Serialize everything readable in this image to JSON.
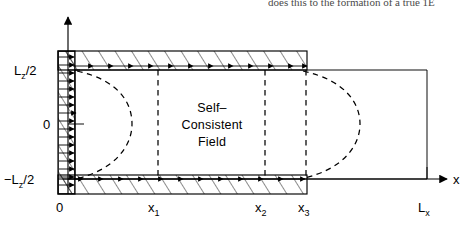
{
  "figure": {
    "kind": "physics-schematic",
    "caption_bleed": "does this to the formation of a true 1E",
    "region_label_lines": [
      "Self–",
      "Consistent",
      "Field"
    ],
    "axes": {
      "x_axis_label": "x",
      "z_axis_label": "",
      "x_ticks": [
        {
          "key": "origin",
          "label": "0",
          "sub": ""
        },
        {
          "key": "x1",
          "label": "x",
          "sub": "1"
        },
        {
          "key": "x2",
          "label": "x",
          "sub": "2"
        },
        {
          "key": "x3",
          "label": "x",
          "sub": "3"
        },
        {
          "key": "Lx",
          "label": "L",
          "sub": "x"
        }
      ],
      "z_ticks": [
        {
          "key": "top",
          "label": "L",
          "sub": "z",
          "suffix": "/2"
        },
        {
          "key": "mid",
          "label": "0",
          "sub": "",
          "suffix": ""
        },
        {
          "key": "bot",
          "label": "−L",
          "sub": "z",
          "suffix": "/2"
        }
      ]
    },
    "colors": {
      "ink": "#000000",
      "background": "#ffffff",
      "bleed_text": "#4a4a4a"
    },
    "elements": {
      "top_wall_name": "top hatched wall",
      "bottom_wall_name": "bottom hatched wall",
      "left_wall_name": "left hatched wall",
      "left_dashed_curve_name": "left dashed separatrix",
      "right_dashed_curve_name": "right dashed separatrix",
      "dashed_verticals": [
        "x1",
        "x2",
        "x3"
      ]
    }
  }
}
